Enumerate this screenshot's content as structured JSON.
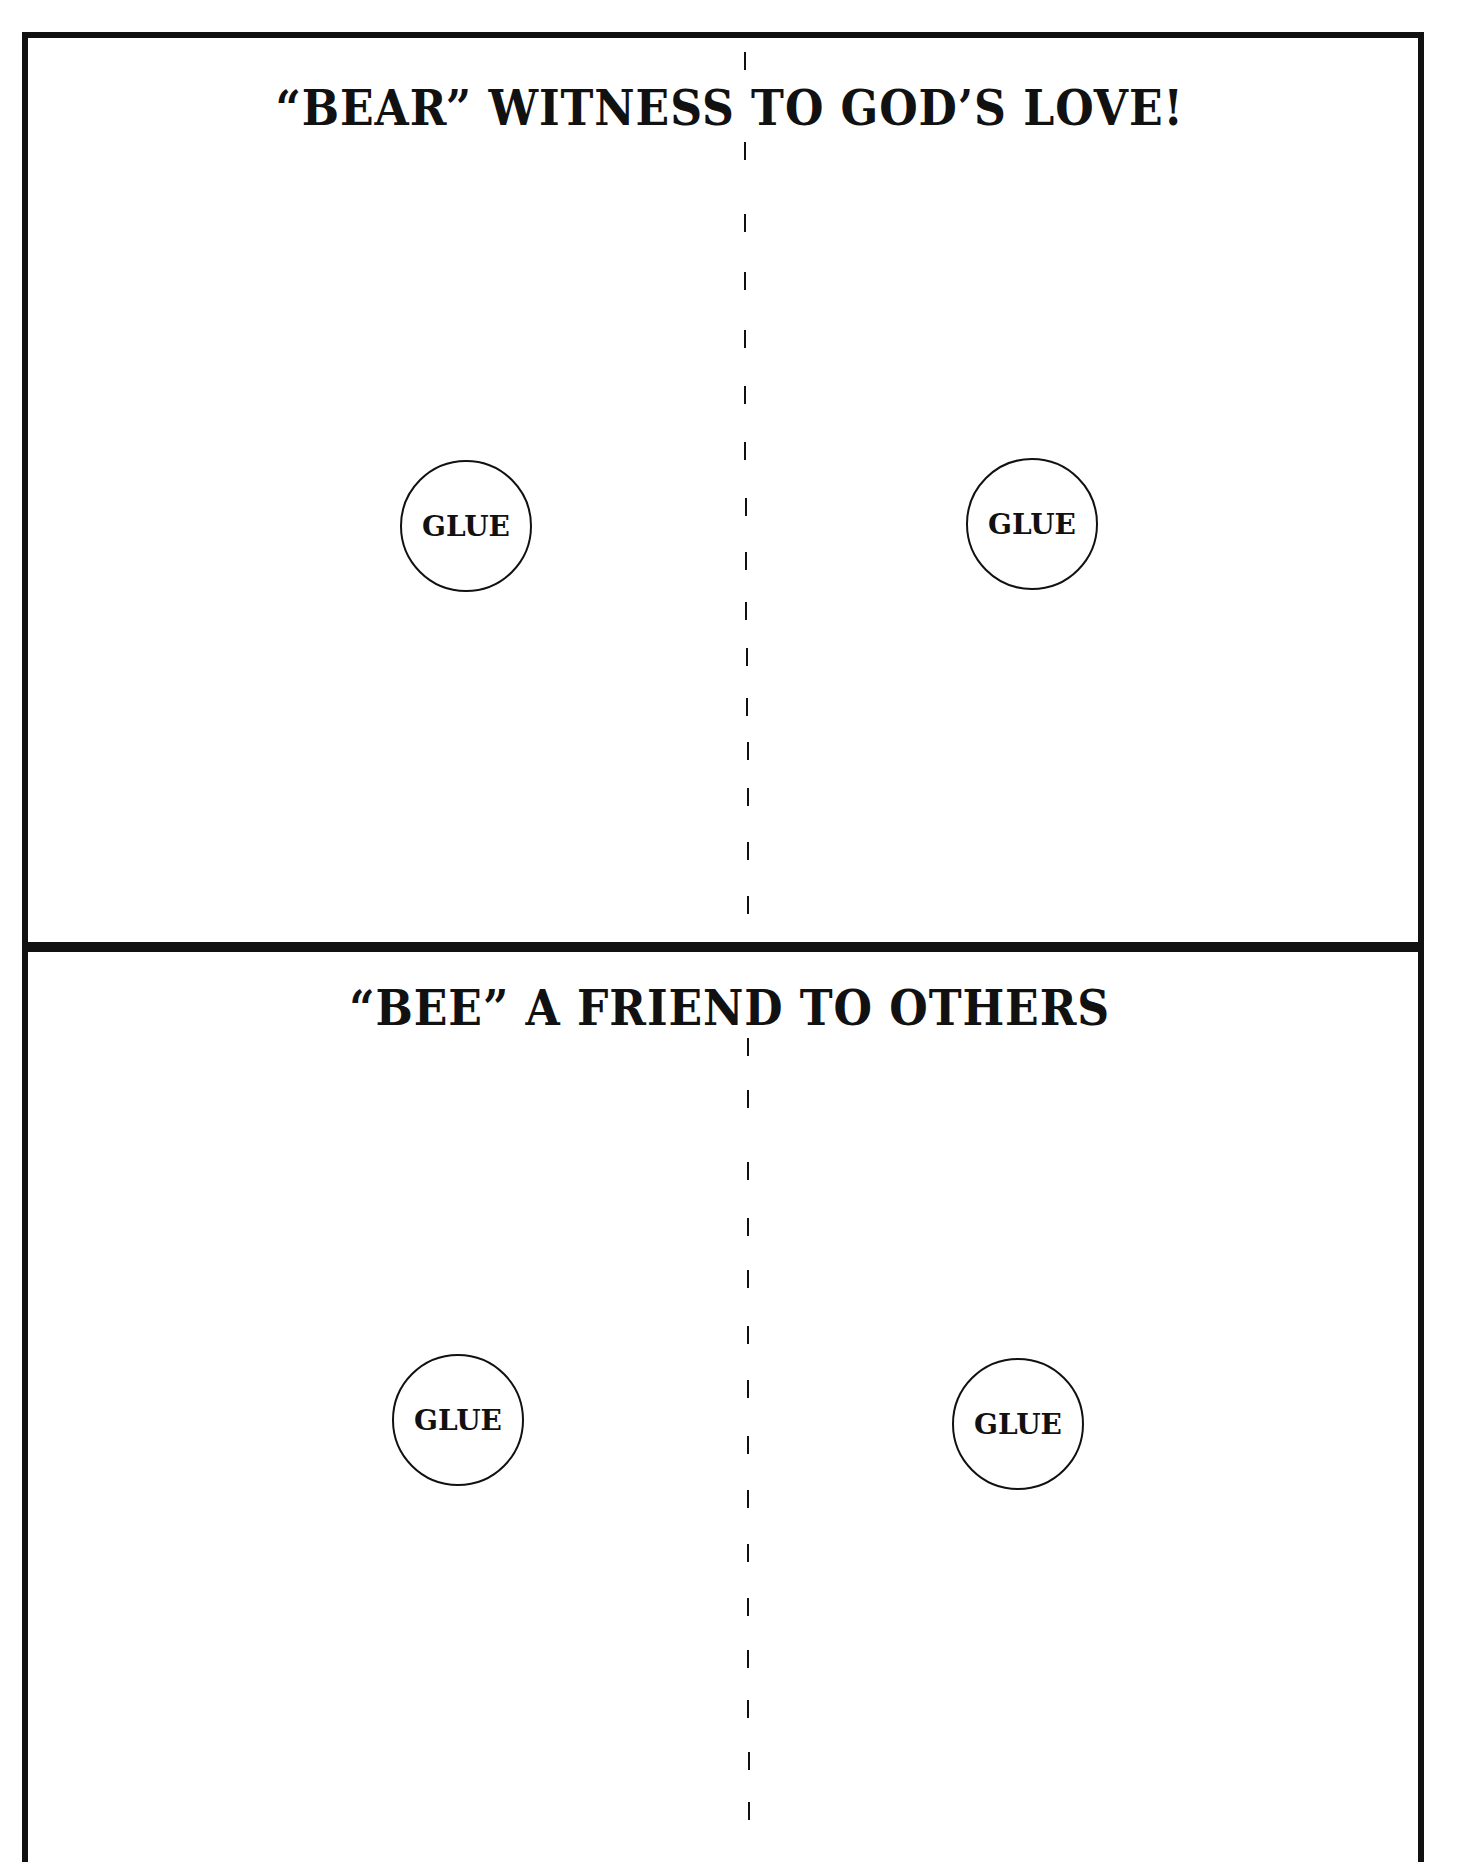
{
  "worksheet": {
    "panels": [
      {
        "title": "“BEAR” WITNESS TO GOD’S LOVE!",
        "glue_spots": [
          {
            "label": "GLUE"
          },
          {
            "label": "GLUE"
          }
        ]
      },
      {
        "title": "“BEE” A FRIEND TO OTHERS",
        "glue_spots": [
          {
            "label": "GLUE"
          },
          {
            "label": "GLUE"
          }
        ]
      }
    ],
    "fold_line": "dashed",
    "colors": {
      "ink": "#111111",
      "paper": "#ffffff"
    }
  }
}
